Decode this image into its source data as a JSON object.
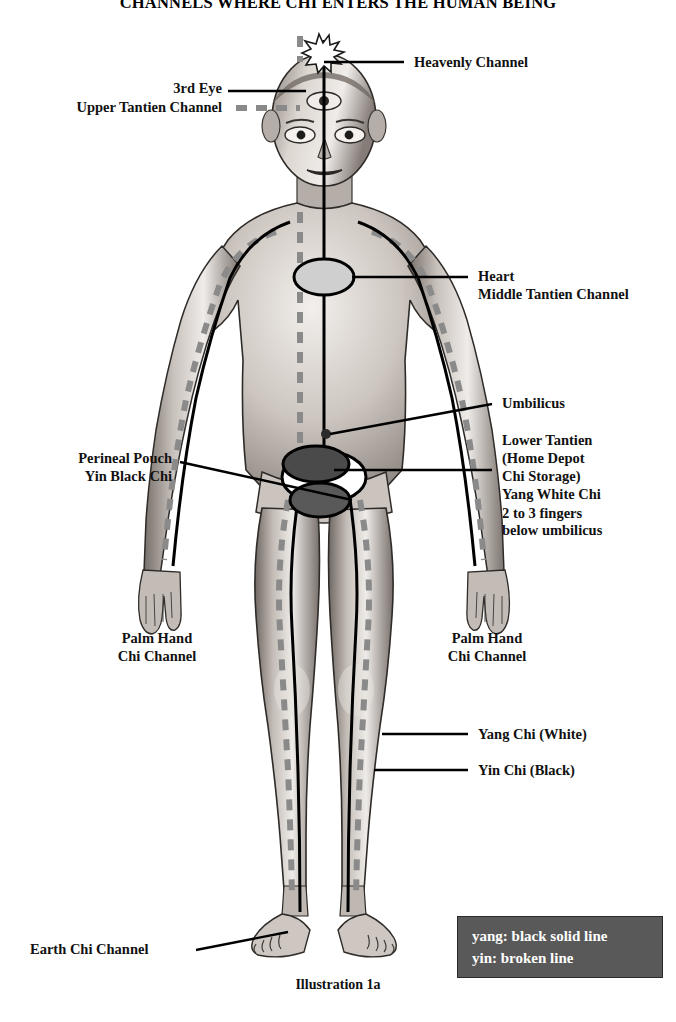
{
  "title": "CHANNELS WHERE CHI ENTERS THE HUMAN BEING",
  "caption": "Illustration 1a",
  "labels": {
    "heavenly_channel": "Heavenly Channel",
    "third_eye": "3rd Eye",
    "upper_tantien_channel": "Upper Tantien Channel",
    "heart": "Heart",
    "middle_tantien_channel": "Middle Tantien Channel",
    "umbilicus": "Umbilicus",
    "lower_tantien": "Lower Tantien",
    "home_depot": "(Home Depot",
    "chi_storage": "Chi Storage)",
    "yang_white_chi": "Yang White Chi",
    "fingers_note_1": "2 to 3 fingers",
    "fingers_note_2": "below umbilicus",
    "perineal_pouch": "Perineal Pouch",
    "yin_black_chi": "Yin Black Chi",
    "palm_hand_left_1": "Palm Hand",
    "palm_hand_left_2": "Chi Channel",
    "palm_hand_right_1": "Palm Hand",
    "palm_hand_right_2": "Chi Channel",
    "yang_chi_white": "Yang Chi (White)",
    "yin_chi_black": "Yin Chi (Black)",
    "earth_chi_channel": "Earth Chi Channel"
  },
  "legend": {
    "yang": "yang: black solid line",
    "yin": "yin: broken line"
  },
  "colors": {
    "yang_line": "#000000",
    "yin_line": "#8a8a8a",
    "legend_background": "#595959",
    "legend_text": "#ffffff",
    "heart_marker": "#cfcfcf",
    "tantien_marker": "#4a4a4a",
    "skin_shade": "#b9b2ad"
  },
  "markers": {
    "crown_star": "starburst-crown-point",
    "heart_ellipse": "heart-middle-tantien",
    "umbilicus_dot": "umbilicus-point",
    "lower_tantien_ellipse": "lower-tantien-yang-white-chi",
    "perineal_ellipse": "perineal-pouch-yin-black-chi"
  }
}
